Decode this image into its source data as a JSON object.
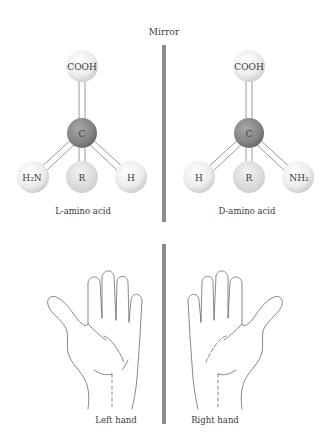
{
  "mirror_label": "Mirror",
  "left_molecule": {
    "top": "COOH",
    "center": "C",
    "bottom_left": "H₂N",
    "bottom_middle": "R",
    "bottom_right": "H",
    "caption": "L-amino acid"
  },
  "right_molecule": {
    "top": "COOH",
    "center": "C",
    "bottom_left": "H",
    "bottom_middle": "R",
    "bottom_right": "NH₂",
    "caption": "D-amino acid"
  },
  "hands": {
    "left_caption": "Left hand",
    "right_caption": "Right hand"
  },
  "colors": {
    "mirror": "#8c8c8c",
    "carbon": "#8a8a8a",
    "atom": "#eeeeee"
  }
}
